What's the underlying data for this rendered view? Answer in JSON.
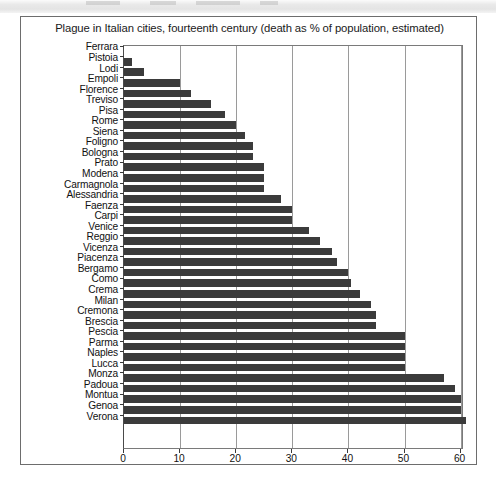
{
  "scan_band": {
    "present": true
  },
  "figure": {
    "title": "Plague in Italian cities, fourteenth century (death as % of population, estimated)",
    "bar_color": "#3b3b3b",
    "frame_color": "#6d6d6d",
    "grid_color": "#9a9a9a"
  },
  "chart_data": {
    "type": "bar",
    "orientation": "horizontal",
    "title": "Plague in Italian cities, fourteenth century (death as % of population, estimated)",
    "xlabel": "",
    "ylabel": "",
    "xlim": [
      0,
      60.6
    ],
    "ticks": [
      0,
      10,
      20,
      30,
      40,
      50,
      60
    ],
    "tick_labels": [
      "0",
      "10",
      "20",
      "30",
      "40",
      "50",
      "60"
    ],
    "grid": "vertical",
    "legend": "none",
    "categories": [
      "Ferrara",
      "Pistoia",
      "Lodi",
      "Empoli",
      "Florence",
      "Treviso",
      "Pisa",
      "Rome",
      "Siena",
      "Foligno",
      "Bologna",
      "Prato",
      "Modena",
      "Carmagnola",
      "Alessandria",
      "Faenza",
      "Carpi",
      "Venice",
      "Reggio",
      "Vicenza",
      "Piacenza",
      "Bergamo",
      "Como",
      "Crema",
      "Milan",
      "Cremona",
      "Brescia",
      "Pescia",
      "Parma",
      "Naples",
      "Lucca",
      "Monza",
      "Padoua",
      "Montua",
      "Genoa",
      "Verona"
    ],
    "values": [
      0,
      1.5,
      3.5,
      10,
      12,
      15.5,
      18,
      20,
      21.5,
      23,
      23,
      25,
      25,
      25,
      28,
      30,
      30,
      33,
      35,
      37,
      38,
      40,
      40.5,
      42,
      44,
      45,
      45,
      50,
      50,
      50,
      50,
      57,
      59,
      60,
      60,
      61
    ]
  }
}
